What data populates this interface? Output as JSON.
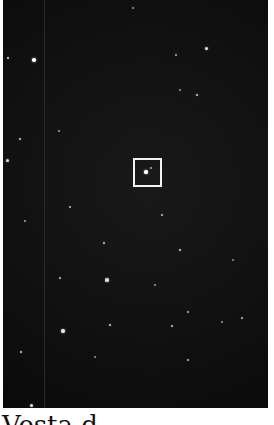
{
  "figure": {
    "image_description": "Dark star field with a highlighted target",
    "target_box": {
      "x": 133,
      "y": 158,
      "width": 29,
      "height": 29,
      "color": "#f2f2f2"
    },
    "stars": [
      {
        "x": 8,
        "y": 58,
        "r": 1.4,
        "o": 0.85
      },
      {
        "x": 34,
        "y": 60,
        "r": 1.8,
        "o": 1.0
      },
      {
        "x": 20,
        "y": 139,
        "r": 1.4,
        "o": 0.8
      },
      {
        "x": 7,
        "y": 160,
        "r": 1.5,
        "o": 0.85
      },
      {
        "x": 59,
        "y": 131,
        "r": 1.1,
        "o": 0.6
      },
      {
        "x": 70,
        "y": 207,
        "r": 1.2,
        "o": 0.7
      },
      {
        "x": 25,
        "y": 221,
        "r": 1.0,
        "o": 0.6
      },
      {
        "x": 104,
        "y": 243,
        "r": 1.3,
        "o": 0.75
      },
      {
        "x": 60,
        "y": 278,
        "r": 1.2,
        "o": 0.7
      },
      {
        "x": 107,
        "y": 280,
        "r": 1.6,
        "o": 0.85
      },
      {
        "x": 63,
        "y": 331,
        "r": 1.7,
        "o": 0.9
      },
      {
        "x": 110,
        "y": 325,
        "r": 1.3,
        "o": 0.8
      },
      {
        "x": 21,
        "y": 352,
        "r": 1.3,
        "o": 0.8
      },
      {
        "x": 31,
        "y": 405,
        "r": 1.5,
        "o": 0.9
      },
      {
        "x": 95,
        "y": 357,
        "r": 1.0,
        "o": 0.55
      },
      {
        "x": 188,
        "y": 360,
        "r": 1.2,
        "o": 0.7
      },
      {
        "x": 206,
        "y": 48,
        "r": 1.5,
        "o": 0.9
      },
      {
        "x": 176,
        "y": 55,
        "r": 1.1,
        "o": 0.65
      },
      {
        "x": 197,
        "y": 95,
        "r": 1.3,
        "o": 0.8
      },
      {
        "x": 180,
        "y": 90,
        "r": 1.0,
        "o": 0.55
      },
      {
        "x": 162,
        "y": 215,
        "r": 1.2,
        "o": 0.7
      },
      {
        "x": 180,
        "y": 250,
        "r": 1.4,
        "o": 0.8
      },
      {
        "x": 155,
        "y": 285,
        "r": 1.0,
        "o": 0.55
      },
      {
        "x": 188,
        "y": 312,
        "r": 1.1,
        "o": 0.65
      },
      {
        "x": 172,
        "y": 326,
        "r": 1.3,
        "o": 0.75
      },
      {
        "x": 242,
        "y": 318,
        "r": 1.2,
        "o": 0.7
      },
      {
        "x": 222,
        "y": 322,
        "r": 1.0,
        "o": 0.55
      },
      {
        "x": 133,
        "y": 8,
        "r": 1.0,
        "o": 0.55
      },
      {
        "x": 233,
        "y": 260,
        "r": 1.0,
        "o": 0.5
      },
      {
        "x": 146,
        "y": 172,
        "r": 1.6,
        "o": 1.0
      },
      {
        "x": 151,
        "y": 168,
        "r": 1.0,
        "o": 0.6
      }
    ]
  },
  "caption": {
    "text": "Vesta d"
  }
}
